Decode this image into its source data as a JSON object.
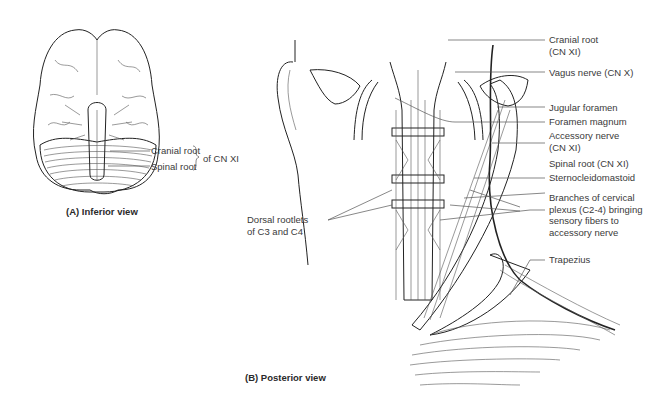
{
  "figure": {
    "panel_a": {
      "caption": "(A) Inferior view",
      "labels": {
        "cranial_root": "Cranial root",
        "spinal_root": "Spinal root",
        "group": "of CN XI"
      }
    },
    "panel_b": {
      "caption": "(B) Posterior view",
      "labels": {
        "cranial_root_l1": "Cranial root",
        "cranial_root_l2": "(CN XI)",
        "vagus": "Vagus nerve (CN X)",
        "jugular": "Jugular foramen",
        "magnum": "Foramen magnum",
        "accessory_l1": "Accessory nerve",
        "accessory_l2": "(CN XI)",
        "spinal_root": "Spinal root (CN XI)",
        "scm": "Sternocleidomastoid",
        "branches_l1": "Branches of cervical",
        "branches_l2": "plexus (C2-4) bringing",
        "branches_l3": "sensory fibers to",
        "branches_l4": "accessory nerve",
        "trapezius": "Trapezius",
        "dorsal_l1": "Dorsal rootlets",
        "dorsal_l2": "of C3 and C4"
      }
    }
  }
}
